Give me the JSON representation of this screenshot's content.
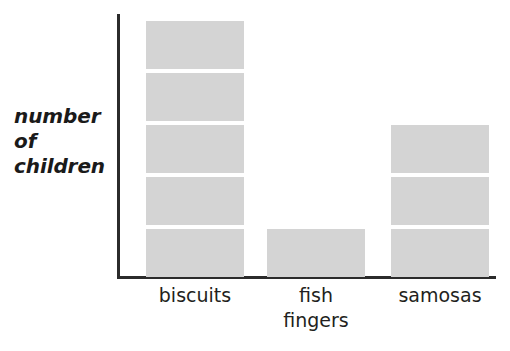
{
  "chart_data": {
    "type": "bar",
    "title": "",
    "subtitle": "",
    "xlabel": "",
    "ylabel": "number\nof\nchildren",
    "categories": [
      "biscuits",
      "fish\nfingers",
      "samosas"
    ],
    "values": [
      5,
      1,
      3
    ],
    "ylim": [
      0,
      5
    ],
    "grid": false,
    "legend": false,
    "unit_note": "each block represents 1 child",
    "series": [
      {
        "name": "number of children",
        "values": [
          5,
          1,
          3
        ]
      }
    ],
    "colors": {
      "bar_fill": "#d4d4d4",
      "axis": "#2b2b2b",
      "label_text": "#231f20",
      "axis_label_text": "#1a1a1a",
      "background": "#ffffff"
    }
  },
  "axes": {
    "y_label": "number\nof\nchildren",
    "x_label": ""
  },
  "bars": [
    {
      "category": "biscuits",
      "label": "biscuits",
      "segments": 5,
      "left": 26
    },
    {
      "category": "fish fingers",
      "label": "fish\nfingers",
      "segments": 1,
      "left": 147
    },
    {
      "category": "samosas",
      "label": "samosas",
      "segments": 3,
      "left": 271
    }
  ]
}
